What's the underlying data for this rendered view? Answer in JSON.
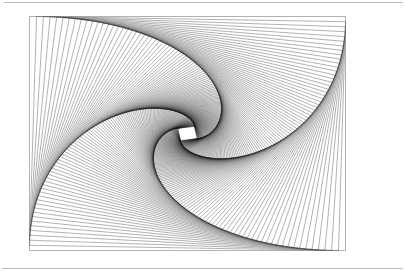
{
  "page": {
    "width": 405,
    "height": 271,
    "background_color": "#ffffff"
  },
  "rules": [
    {
      "name": "top-rule",
      "x": 4,
      "y": 2,
      "width": 399,
      "color": "#b9b9b9"
    },
    {
      "name": "bottom-rule",
      "x": 2,
      "y": 268,
      "width": 401,
      "color": "#b9b9b9"
    }
  ],
  "figure": {
    "type": "geometric-line-figure",
    "stroke_color": "#1a1a1a",
    "stroke_width": 0.34,
    "fill": "none",
    "background_color": "#ffffff",
    "outer_rect": {
      "x": 29.5,
      "y": 16.5,
      "width": 316,
      "height": 234
    },
    "construction": {
      "method": "each successive quadrilateral has its vertices placed at a fixed fraction along the edges of the previous quadrilateral",
      "rotation_direction": "clockwise",
      "step_fraction": 0.0222,
      "iterations": 132,
      "arms_visible": 4
    },
    "convergence_center": {
      "x": 185,
      "y": 136,
      "description": "dense black convergence point with a tiny white quadrilateral at the exact center"
    }
  }
}
